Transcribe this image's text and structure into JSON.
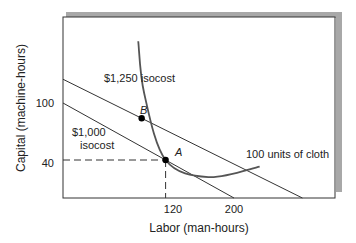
{
  "chart_data": {
    "type": "line",
    "title": "",
    "xlabel": "Labor (man-hours)",
    "ylabel": "Capital (machine-hours)",
    "xlim": [
      0,
      300
    ],
    "ylim": [
      0,
      195
    ],
    "x_ticks": [
      {
        "value": 120,
        "label": "120"
      },
      {
        "value": 200,
        "label": "200"
      }
    ],
    "y_ticks": [
      {
        "value": 100,
        "label": "100"
      },
      {
        "value": 40,
        "label": "40"
      }
    ],
    "grid": false,
    "series": [
      {
        "name": "$1,250 isocost",
        "label": "$1,250 isocost",
        "points": [
          [
            0,
            125
          ],
          [
            280,
            0
          ]
        ]
      },
      {
        "name": "$1,000 isocost",
        "label_line1": "$1,000",
        "label_line2": "isocost",
        "points": [
          [
            0,
            100
          ],
          [
            200,
            0
          ]
        ]
      },
      {
        "name": "100 units of cloth",
        "label": "100 units of cloth",
        "type": "curve",
        "points": [
          [
            88,
            165
          ],
          [
            95,
            110
          ],
          [
            120,
            40
          ],
          [
            170,
            22
          ],
          [
            230,
            33
          ]
        ]
      }
    ],
    "points": [
      {
        "label": "A",
        "x": 120,
        "y": 40
      },
      {
        "label": "B",
        "x": 92,
        "y": 84
      }
    ],
    "guides": [
      {
        "from": [
          0,
          40
        ],
        "to": [
          120,
          40
        ]
      },
      {
        "from": [
          120,
          40
        ],
        "to": [
          120,
          0
        ]
      }
    ]
  }
}
